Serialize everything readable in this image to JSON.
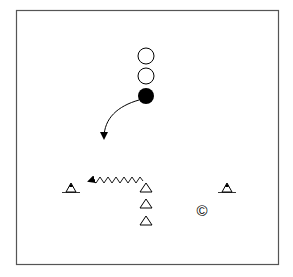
{
  "diagram": {
    "type": "sports-drill",
    "field": {
      "x": 16,
      "y": 10,
      "width": 263,
      "height": 255,
      "stroke": "#555555"
    },
    "players_open": [
      {
        "label": "player-circle-open-1",
        "cx": 146,
        "cy": 56,
        "r": 8
      },
      {
        "label": "player-circle-open-2",
        "cx": 146,
        "cy": 76,
        "r": 8
      }
    ],
    "player_filled": {
      "label": "player-circle-filled",
      "cx": 146,
      "cy": 96,
      "r": 8,
      "color": "#000000"
    },
    "run_arrow": {
      "from": [
        138,
        100
      ],
      "to": [
        104,
        140
      ]
    },
    "dribble_arrow": {
      "from": [
        143,
        181
      ],
      "to": [
        86,
        181
      ]
    },
    "cones": [
      {
        "name": "cone-left",
        "x": 71,
        "y": 191,
        "with_base": true
      },
      {
        "name": "cone-middle-1",
        "x": 146,
        "y": 191,
        "with_base": false
      },
      {
        "name": "cone-middle-2",
        "x": 146,
        "y": 207,
        "with_base": false
      },
      {
        "name": "cone-middle-3",
        "x": 146,
        "y": 224,
        "with_base": false
      },
      {
        "name": "cone-right",
        "x": 227,
        "y": 191,
        "with_base": true
      }
    ],
    "coach": {
      "symbol": "©",
      "cx": 202,
      "cy": 211
    }
  }
}
